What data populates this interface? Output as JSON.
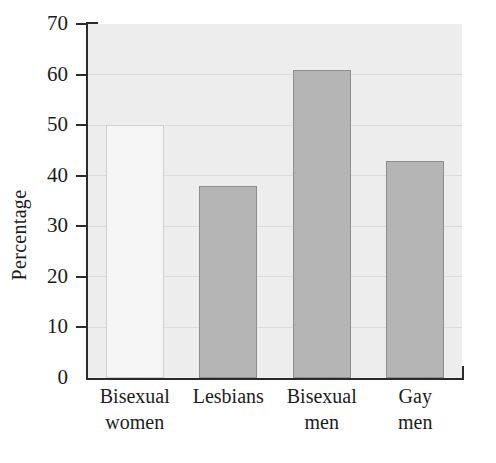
{
  "chart_data": {
    "type": "bar",
    "title": "",
    "xlabel": "",
    "ylabel": "Percentage",
    "ylim": [
      0,
      70
    ],
    "ytick_step": 10,
    "grid": true,
    "legend": "none",
    "categories": [
      "Bisexual women",
      "Lesbians",
      "Bisexual men",
      "Gay men"
    ],
    "values": [
      50,
      38,
      61,
      43
    ],
    "bars": [
      {
        "label_line1": "Bisexual",
        "label_line2": "women",
        "value": 50,
        "fill": "hollow"
      },
      {
        "label_line1": "Lesbians",
        "label_line2": "",
        "value": 38,
        "fill": "filled"
      },
      {
        "label_line1": "Bisexual",
        "label_line2": "men",
        "value": 61,
        "fill": "filled"
      },
      {
        "label_line1": "Gay",
        "label_line2": "men",
        "value": 43,
        "fill": "filled"
      }
    ],
    "yticks": [
      70,
      60,
      50,
      40,
      30,
      20,
      10,
      0
    ],
    "colors": {
      "bar_fill": "#b5b5b5",
      "bar_edge": "#8e8e8e",
      "bar_hollow_fill": "#f6f6f6",
      "plot_background": "#ededed",
      "axis": "#2b2b2b",
      "gridline": "#dcdcdc",
      "text": "#1c1c1c"
    }
  }
}
